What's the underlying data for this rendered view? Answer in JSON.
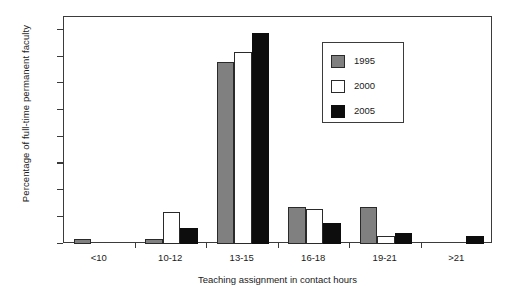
{
  "chart_data": {
    "type": "bar",
    "title": "",
    "xlabel": "Teaching assignment in contact hours",
    "ylabel": "Percentage of full-time permanent faculty",
    "categories": [
      "<10",
      "10-12",
      "13-15",
      "16-18",
      "19-21",
      ">21"
    ],
    "series": [
      {
        "name": "1995",
        "color": "#808080",
        "values": [
          2,
          2,
          68,
          14,
          14,
          0
        ]
      },
      {
        "name": "2000",
        "color": "#ffffff",
        "values": [
          0,
          12,
          72,
          13,
          3,
          0
        ]
      },
      {
        "name": "2005",
        "color": "#0d0d0d",
        "values": [
          0,
          6,
          79,
          8,
          4,
          3
        ]
      }
    ],
    "ylim": [
      0,
      85
    ],
    "yticks": [
      0,
      10,
      20,
      30,
      40,
      50,
      60,
      70,
      80
    ],
    "ytick_labels": [
      "0",
      "10",
      "20",
      "30",
      "40",
      "50",
      "60",
      "70",
      "80"
    ],
    "grid": false,
    "legend_position": "upper right",
    "legend_entries": [
      "1995",
      "2000",
      "2005"
    ]
  },
  "axis": {
    "y_title": "Percentage of full-time permanent faculty",
    "x_title": "Teaching assignment in contact hours"
  }
}
